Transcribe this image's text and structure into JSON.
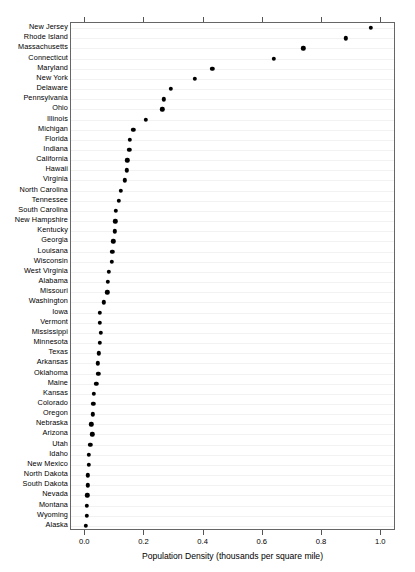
{
  "chart_data": {
    "type": "scatter",
    "subtype": "cleveland-dot-plot",
    "title": "",
    "xlabel": "Population Density (thousands per square mile)",
    "ylabel": "",
    "xlim": [
      -0.048,
      1.05
    ],
    "xticks": [
      0.0,
      0.2,
      0.4,
      0.6,
      0.8,
      1.0
    ],
    "xticklabels": [
      "0.0",
      "0.2",
      "0.4",
      "0.6",
      "0.8",
      "1.0"
    ],
    "grid": true,
    "grid_axis": "y",
    "legend": "none",
    "marker": "filled-circle",
    "marker_color": "#000000",
    "categories": [
      "New Jersey",
      "Rhode Island",
      "Massachusetts",
      "Connecticut",
      "Maryland",
      "New York",
      "Delaware",
      "Pennsylvania",
      "Ohio",
      "Illinois",
      "Michigan",
      "Florida",
      "Indiana",
      "California",
      "Hawaii",
      "Virginia",
      "North Carolina",
      "Tennessee",
      "South Carolina",
      "New Hampshire",
      "Kentucky",
      "Georgia",
      "Louisana",
      "Wisconsin",
      "West Virginia",
      "Alabama",
      "Missouri",
      "Washington",
      "Iowa",
      "Vermont",
      "Mississippi",
      "Minnesota",
      "Texas",
      "Arkansas",
      "Oklahoma",
      "Maine",
      "Kansas",
      "Colorado",
      "Oregon",
      "Nebraska",
      "Arizona",
      "Utah",
      "Idaho",
      "New Mexico",
      "North Dakota",
      "South Dakota",
      "Nevada",
      "Montana",
      "Wyoming",
      "Alaska"
    ],
    "values": [
      0.965,
      0.88,
      0.737,
      0.638,
      0.429,
      0.37,
      0.289,
      0.265,
      0.26,
      0.205,
      0.163,
      0.151,
      0.149,
      0.142,
      0.14,
      0.134,
      0.12,
      0.113,
      0.104,
      0.102,
      0.099,
      0.095,
      0.092,
      0.09,
      0.08,
      0.077,
      0.074,
      0.063,
      0.05,
      0.049,
      0.053,
      0.05,
      0.046,
      0.043,
      0.044,
      0.037,
      0.03,
      0.027,
      0.026,
      0.02,
      0.024,
      0.017,
      0.012,
      0.012,
      0.009,
      0.009,
      0.007,
      0.005,
      0.005,
      0.001
    ]
  }
}
